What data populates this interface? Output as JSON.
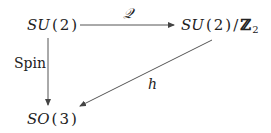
{
  "diagram": {
    "type": "commutative-diagram",
    "nodes": {
      "su2": {
        "group": "SU",
        "arg": "2",
        "display": "SU(2)"
      },
      "quotient": {
        "group": "SU",
        "arg": "2",
        "slash": "/",
        "ring": "ℤ",
        "ring_sub": "2",
        "display": "SU(2)/ℤ₂"
      },
      "so3": {
        "group": "SO",
        "arg": "3",
        "display": "SO(3)"
      }
    },
    "edges": [
      {
        "from": "SU(2)",
        "to": "SU(2)/ℤ₂",
        "label": "𝒬"
      },
      {
        "from": "SU(2)",
        "to": "SO(3)",
        "label": "Spin"
      },
      {
        "from": "SU(2)/ℤ₂",
        "to": "SO(3)",
        "label": "h"
      }
    ],
    "colors": {
      "stroke": "#555555",
      "text": "#222222",
      "background": "#ffffff"
    }
  }
}
